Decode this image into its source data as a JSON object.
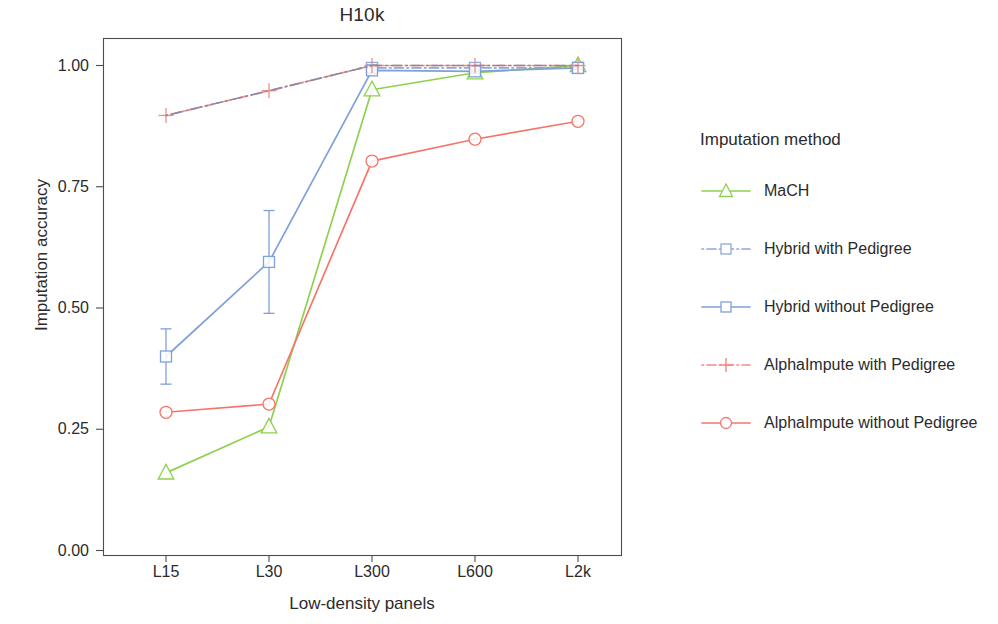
{
  "chart_data": {
    "type": "line",
    "title": "H10k",
    "xlabel": "Low-density panels",
    "ylabel": "Imputation accuracy",
    "categories": [
      "L15",
      "L30",
      "L300",
      "L600",
      "L2k"
    ],
    "ylim": [
      0.0,
      1.04
    ],
    "yticks": [
      "0.00",
      "0.25",
      "0.50",
      "0.75",
      "1.00"
    ],
    "ytick_values": [
      0.0,
      0.25,
      0.5,
      0.75,
      1.0
    ],
    "grid": false,
    "legend_position": "right",
    "legend_title": "Imputation method",
    "series": [
      {
        "name": "MaCH",
        "color": "#8FD14F",
        "marker": "triangle",
        "linestyle": "solid",
        "values": [
          0.16,
          0.255,
          0.95,
          0.985,
          1.0
        ],
        "errors": [
          0,
          0,
          0,
          0,
          0
        ]
      },
      {
        "name": "Hybrid with Pedigree",
        "color": "#8FA8DC",
        "marker": "square",
        "linestyle": "dotdash",
        "values": [
          null,
          null,
          0.995,
          0.995,
          0.995
        ],
        "errors": [
          0,
          0,
          0,
          0,
          0
        ]
      },
      {
        "name": "Hybrid without Pedigree",
        "color": "#7FA0D8",
        "marker": "square",
        "linestyle": "solid",
        "values": [
          0.4,
          0.595,
          0.99,
          0.988,
          0.995
        ],
        "errors": [
          0.057,
          0.106,
          0.005,
          0.004,
          0.003
        ]
      },
      {
        "name": "AlphaImpute with Pedigree",
        "color": "#F08E85",
        "marker": "plus",
        "linestyle": "dotdash",
        "values": [
          0.897,
          0.948,
          1.0,
          1.0,
          1.0
        ],
        "errors": [
          0,
          0,
          0,
          0,
          0
        ]
      },
      {
        "name": "AlphaImpute without Pedigree",
        "color": "#F4766B",
        "marker": "circle",
        "linestyle": "solid",
        "values": [
          0.285,
          0.302,
          0.803,
          0.848,
          0.885
        ],
        "errors": [
          0,
          0,
          0,
          0,
          0
        ]
      }
    ],
    "connector_line": {
      "description": "dot-dash grey-purple line joining the with-Pedigree series",
      "color": "#8C86A8"
    }
  },
  "axes": {
    "frame_color": "#4d4d4d",
    "background": "#ffffff"
  }
}
